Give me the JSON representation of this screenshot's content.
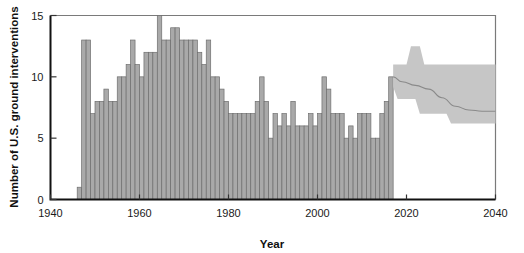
{
  "chart_data": {
    "type": "bar",
    "title": "",
    "xlabel": "Year",
    "ylabel": "Number of U.S. ground interventions",
    "xlim": [
      1940,
      2040
    ],
    "ylim": [
      0,
      15
    ],
    "xticks": [
      1940,
      1960,
      1980,
      2000,
      2020,
      2040
    ],
    "yticks": [
      0,
      5,
      10,
      15
    ],
    "grid": false,
    "legend": "none",
    "bar_color": "#a9a9a9",
    "bar_edge_color": "#6e6e6e",
    "band_color": "#c6c6c6",
    "median_color": "#8a8a8a",
    "categories": [
      1946,
      1947,
      1948,
      1949,
      1950,
      1951,
      1952,
      1953,
      1954,
      1955,
      1956,
      1957,
      1958,
      1959,
      1960,
      1961,
      1962,
      1963,
      1964,
      1965,
      1966,
      1967,
      1968,
      1969,
      1970,
      1971,
      1972,
      1973,
      1974,
      1975,
      1976,
      1977,
      1978,
      1979,
      1980,
      1981,
      1982,
      1983,
      1984,
      1985,
      1986,
      1987,
      1988,
      1989,
      1990,
      1991,
      1992,
      1993,
      1994,
      1995,
      1996,
      1997,
      1998,
      1999,
      2000,
      2001,
      2002,
      2003,
      2004,
      2005,
      2006,
      2007,
      2008,
      2009,
      2010,
      2011,
      2012,
      2013,
      2014,
      2015,
      2016
    ],
    "values": [
      1,
      13,
      13,
      7,
      8,
      8,
      9,
      8,
      8,
      10,
      10,
      11,
      13,
      11,
      10,
      12,
      12,
      12,
      15,
      13,
      13,
      14,
      14,
      13,
      13,
      13,
      13,
      12,
      11,
      13,
      10,
      10,
      9,
      8,
      7,
      7,
      7,
      7,
      7,
      7,
      8,
      10,
      8,
      5,
      7,
      6,
      7,
      6,
      8,
      6,
      6,
      6,
      7,
      6,
      7,
      10,
      9,
      7,
      7,
      7,
      5,
      6,
      5,
      7,
      7,
      7,
      5,
      5,
      7,
      8,
      10
    ],
    "forecast": {
      "label": "projection",
      "start_year": 2017,
      "end_year": 2040,
      "median": [
        {
          "year": 2017,
          "value": 10.0
        },
        {
          "year": 2019,
          "value": 9.6
        },
        {
          "year": 2022,
          "value": 9.3
        },
        {
          "year": 2025,
          "value": 9.0
        },
        {
          "year": 2028,
          "value": 8.3
        },
        {
          "year": 2031,
          "value": 7.6
        },
        {
          "year": 2034,
          "value": 7.3
        },
        {
          "year": 2037,
          "value": 7.2
        },
        {
          "year": 2040,
          "value": 7.2
        }
      ],
      "upper": [
        {
          "year": 2017,
          "value": 11.0
        },
        {
          "year": 2020,
          "value": 11.0
        },
        {
          "year": 2021,
          "value": 12.5
        },
        {
          "year": 2023,
          "value": 12.5
        },
        {
          "year": 2024,
          "value": 11.0
        },
        {
          "year": 2040,
          "value": 11.0
        }
      ],
      "lower": [
        {
          "year": 2017,
          "value": 9.2
        },
        {
          "year": 2018,
          "value": 8.2
        },
        {
          "year": 2022,
          "value": 8.2
        },
        {
          "year": 2023,
          "value": 7.0
        },
        {
          "year": 2029,
          "value": 7.0
        },
        {
          "year": 2030,
          "value": 6.2
        },
        {
          "year": 2040,
          "value": 6.2
        }
      ]
    }
  }
}
